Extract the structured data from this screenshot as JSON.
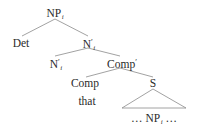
{
  "diagram": {
    "type": "syntax-tree",
    "nodes": {
      "root": {
        "label": "NP",
        "sub": "i",
        "prime": ""
      },
      "det": {
        "label": "Det",
        "sub": "",
        "prime": ""
      },
      "nbar_upper": {
        "label": "N",
        "sub": "i",
        "prime": "′"
      },
      "nbar_lower": {
        "label": "N",
        "sub": "i",
        "prime": "′"
      },
      "compbar": {
        "label": "Comp",
        "sub": "",
        "prime": "′"
      },
      "comp": {
        "label": "Comp",
        "sub": "",
        "prime": ""
      },
      "s": {
        "label": "S",
        "sub": "",
        "prime": ""
      },
      "that": {
        "label": "that"
      },
      "s_content": {
        "pre": "… NP",
        "sub": "i",
        "post": " …"
      }
    },
    "edges": [
      [
        "root",
        "det"
      ],
      [
        "root",
        "nbar_upper"
      ],
      [
        "nbar_upper",
        "nbar_lower"
      ],
      [
        "nbar_upper",
        "compbar"
      ],
      [
        "compbar",
        "comp"
      ],
      [
        "compbar",
        "s"
      ],
      [
        "comp",
        "that"
      ],
      [
        "s",
        "s_content (triangle)"
      ]
    ],
    "colors": {
      "text": "#2a2a2a",
      "edge": "#8a8a8a",
      "background": "#ffffff"
    }
  }
}
